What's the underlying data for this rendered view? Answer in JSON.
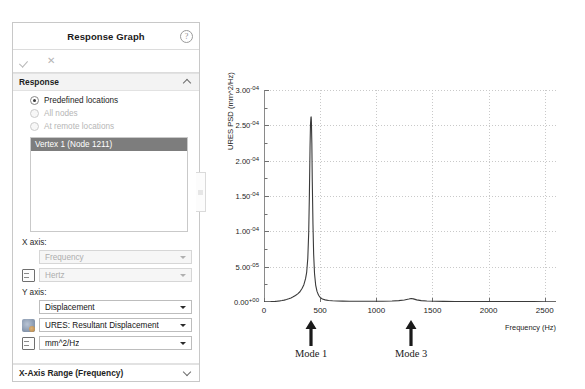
{
  "panel": {
    "title": "Response Graph",
    "help_icon": "help-icon",
    "accept_icon": "check-icon",
    "cancel_icon": "close-icon",
    "sections": {
      "response": {
        "label": "Response",
        "options": [
          {
            "label": "Predefined locations",
            "selected": true,
            "enabled": true
          },
          {
            "label": "All nodes",
            "selected": false,
            "enabled": false
          },
          {
            "label": "At remote locations",
            "selected": false,
            "enabled": false
          }
        ],
        "list_selected_item": "Vertex 1 (Node 1211)"
      },
      "x_axis": {
        "label": "X axis:",
        "quantity": "Frequency",
        "unit": "Hertz",
        "enabled": false
      },
      "y_axis": {
        "label": "Y axis:",
        "quantity": "Displacement",
        "component": "URES:  Resultant Displacement",
        "unit": "mm^2/Hz",
        "enabled": true
      },
      "x_axis_range": {
        "label": "X-Axis Range  (Frequency)"
      }
    }
  },
  "chart_data": {
    "type": "line",
    "title": "",
    "xlabel": "Frequency (Hz)",
    "ylabel": "URES PSD (mm^2/Hz)",
    "xlim": [
      0,
      2600
    ],
    "ylim": [
      0,
      0.0003
    ],
    "grid": true,
    "legend": false,
    "xticks": [
      0,
      500,
      1000,
      1500,
      2000,
      2500
    ],
    "xtick_labels": [
      "0",
      "500",
      "1000",
      "1500",
      "2000",
      "2500"
    ],
    "yticks": [
      0,
      5e-05,
      0.0001,
      0.00015,
      0.0002,
      0.00025,
      0.0003
    ],
    "ytick_labels": [
      {
        "mantissa": "0.00",
        "exp": "e+00"
      },
      {
        "mantissa": "5.00",
        "exp": "e-05"
      },
      {
        "mantissa": "1.00",
        "exp": "e-04"
      },
      {
        "mantissa": "1.50",
        "exp": "e-04"
      },
      {
        "mantissa": "2.00",
        "exp": "e-04"
      },
      {
        "mantissa": "2.50",
        "exp": "e-04"
      },
      {
        "mantissa": "3.00",
        "exp": "e-04"
      }
    ],
    "series": [
      {
        "name": "URES PSD",
        "color": "#3a3a3a",
        "x": [
          0,
          20,
          40,
          60,
          80,
          100,
          120,
          140,
          160,
          180,
          200,
          220,
          240,
          260,
          280,
          300,
          320,
          340,
          355,
          370,
          380,
          390,
          398,
          404,
          410,
          414,
          418,
          420,
          422,
          426,
          430,
          436,
          442,
          450,
          460,
          472,
          486,
          500,
          520,
          545,
          575,
          610,
          650,
          700,
          760,
          830,
          900,
          980,
          1060,
          1140,
          1200,
          1250,
          1290,
          1310,
          1330,
          1360,
          1400,
          1450,
          1520,
          1600,
          1700,
          1800,
          1900,
          2000,
          2100,
          2200,
          2300,
          2400,
          2500,
          2600
        ],
        "y": [
          2e-07,
          3e-07,
          4e-07,
          5e-07,
          7e-07,
          9e-07,
          1.2e-06,
          1.6e-06,
          2.1e-06,
          2.7e-06,
          3.5e-06,
          4.5e-06,
          5.8e-06,
          7.3e-06,
          9.2e-06,
          1.15e-05,
          1.45e-05,
          1.95e-05,
          2.45e-05,
          3.3e-05,
          4.2e-05,
          6.2e-05,
          9.8e-05,
          0.00015,
          0.00022,
          0.000252,
          0.0002615,
          0.000262,
          0.000256,
          0.000225,
          0.00017,
          0.00011,
          6.8e-05,
          4e-05,
          2.4e-05,
          1.5e-05,
          9.5e-06,
          6.5e-06,
          4.2e-06,
          3e-06,
          2.2e-06,
          1.7e-06,
          1.4e-06,
          1.2e-06,
          1.1e-06,
          1e-06,
          1e-06,
          1e-06,
          1.1e-06,
          1.4e-06,
          1.9e-06,
          2.8e-06,
          4.2e-06,
          5e-06,
          4.4e-06,
          3e-06,
          2e-06,
          1.4e-06,
          1.1e-06,
          9e-07,
          8e-07,
          7e-07,
          7e-07,
          6e-07,
          6e-07,
          5e-07,
          5e-07,
          5e-07,
          4e-07,
          4e-07
        ]
      }
    ],
    "annotations": [
      {
        "label": "Mode 1",
        "x": 420,
        "marker": "up-arrow"
      },
      {
        "label": "Mode 3",
        "x": 1310,
        "marker": "up-arrow"
      }
    ]
  }
}
